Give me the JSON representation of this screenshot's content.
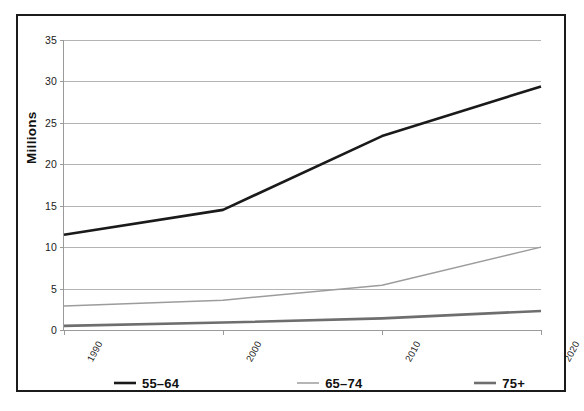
{
  "chart_data": {
    "type": "line",
    "title": "",
    "subtitle": "",
    "xlabel": "",
    "ylabel": "Millions",
    "x": [
      "1990",
      "2000",
      "2010",
      "2020"
    ],
    "categories": [
      "1990",
      "2000",
      "2010",
      "2020"
    ],
    "xlim": [
      1990,
      2020
    ],
    "ylim": [
      0,
      35
    ],
    "yticks": [
      0,
      5,
      10,
      15,
      20,
      25,
      30,
      35
    ],
    "ytick_labels": [
      "0",
      "5",
      "10",
      "15",
      "20",
      "25",
      "30",
      "35"
    ],
    "grid": "horizontal",
    "legend_position": "bottom",
    "series": [
      {
        "name": "55-64",
        "label": "55–64",
        "color": "#1a1a1a",
        "width": 2.6,
        "values": [
          11.5,
          14.5,
          23.4,
          29.4
        ]
      },
      {
        "name": "65-74",
        "label": "65–74",
        "color": "#9c9c9c",
        "width": 1.5,
        "values": [
          2.9,
          3.6,
          5.4,
          10.0
        ]
      },
      {
        "name": "75+",
        "label": "75+",
        "color": "#6e6e6e",
        "width": 2.6,
        "values": [
          0.5,
          0.9,
          1.4,
          2.3
        ]
      }
    ]
  },
  "axes": {
    "y_title": "Millions",
    "y_tick_labels": [
      "35",
      "30",
      "25",
      "20",
      "15",
      "10",
      "5",
      "0"
    ],
    "x_tick_labels": [
      "1990",
      "2000",
      "2010",
      "2020"
    ]
  },
  "legend": {
    "entries": [
      {
        "label": "55–64",
        "color": "#1a1a1a"
      },
      {
        "label": "65–74",
        "color": "#9c9c9c"
      },
      {
        "label": "75+",
        "color": "#6e6e6e"
      }
    ]
  },
  "colors": {
    "frame": "#1b1b1b",
    "gridline": "#b4b4b4",
    "axis": "#9a9a9a",
    "background": "#ffffff",
    "text": "#111111"
  }
}
